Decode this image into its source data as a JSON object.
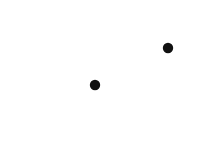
{
  "figure": {
    "type": "physics-field-diagram",
    "background_color": "#ffffff",
    "stroke_color": "#111111",
    "width": 209,
    "height": 166
  },
  "labels": {
    "source_charge": "Q",
    "test_charge": "q",
    "force": "F",
    "distance": "r"
  },
  "source_charge": {
    "name": "Q",
    "cx": 95,
    "cy": 85,
    "radius": 5.2,
    "fill": "#111111"
  },
  "test_charge": {
    "name": "q",
    "cx": 168,
    "cy": 48,
    "radius": 5.2,
    "fill": "#111111"
  },
  "separation_vector": {
    "name": "r",
    "style": "dotted",
    "from_x": 102,
    "from_y": 82,
    "to_x": 161,
    "to_y": 52,
    "dot_count": 16,
    "arrowhead": true
  },
  "force_vector": {
    "name": "F",
    "style": "solid",
    "from_x": 174,
    "from_y": 45,
    "to_x": 199,
    "to_y": 31,
    "arrowhead": true
  },
  "field_rays": {
    "count": 8,
    "segments_per_ray": 3,
    "angles_degrees": [
      0,
      45,
      90,
      135,
      180,
      225,
      270,
      315
    ],
    "direction": "outward",
    "segment_lengths": [
      30,
      20,
      12
    ],
    "segment_gaps": [
      8,
      8
    ],
    "inner_radius": 8
  },
  "chart_data": {
    "type": "scatter",
    "xlabel": "",
    "ylabel": "",
    "annotations": [
      "Q",
      "q",
      "F",
      "r"
    ],
    "points": [
      {
        "label": "Q",
        "x": 95,
        "y": 85,
        "role": "source-charge"
      },
      {
        "label": "q",
        "x": 168,
        "y": 48,
        "role": "test-charge"
      }
    ],
    "vectors": [
      {
        "label": "r",
        "from": [
          95,
          85
        ],
        "to": [
          168,
          48
        ],
        "style": "dotted"
      },
      {
        "label": "F",
        "from": [
          174,
          45
        ],
        "to": [
          199,
          31
        ],
        "style": "solid"
      }
    ],
    "radial_field_angles": [
      0,
      45,
      90,
      135,
      180,
      225,
      270,
      315
    ]
  }
}
